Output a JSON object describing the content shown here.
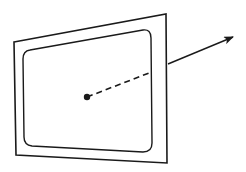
{
  "diagram": {
    "colors": {
      "stroke": "#1a1a1a",
      "background": "#ffffff"
    },
    "outer_frame": {
      "points": [
        [
          14,
          42
        ],
        [
          166,
          14
        ],
        [
          167,
          163
        ],
        [
          16,
          155
        ]
      ]
    },
    "inner_panel": {
      "path": "M 30 50 L 143 30 Q 151 29 151 38 L 152 143 Q 152 152 143 152 L 32 146 Q 24 145 24 137 L 23 59 Q 23 51 30 50 Z"
    },
    "center_point": {
      "cx": 87,
      "cy": 97,
      "r": 3.2
    },
    "hidden_segment": {
      "x1": 87,
      "y1": 97,
      "x2": 149,
      "y2": 73,
      "dash": "6,4"
    },
    "normal_vector": {
      "x1": 168,
      "y1": 64,
      "x2": 233,
      "y2": 37
    }
  }
}
